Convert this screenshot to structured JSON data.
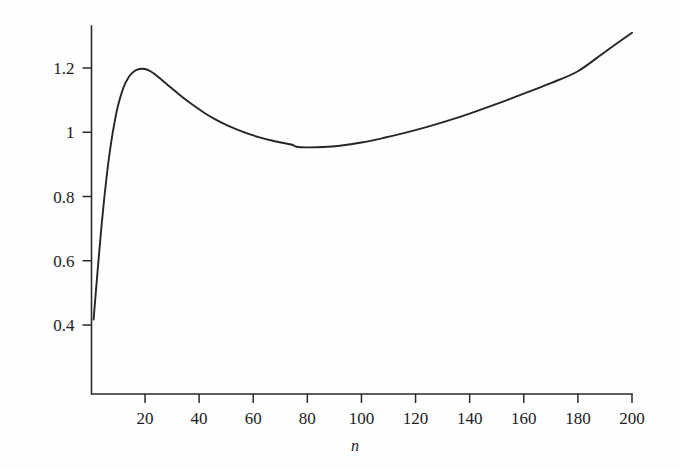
{
  "chart_data": {
    "type": "line",
    "title": "",
    "subtitle": "",
    "xlabel": "n",
    "ylabel": "",
    "xlim": [
      0,
      203
    ],
    "ylim": [
      0.28,
      1.34
    ],
    "grid": false,
    "legend": null,
    "xticks": [
      20,
      40,
      60,
      80,
      100,
      120,
      140,
      160,
      180,
      200
    ],
    "xtick_labels": [
      "20",
      "40",
      "60",
      "80",
      "100",
      "120",
      "140",
      "160",
      "180",
      "200"
    ],
    "yticks": [
      0.4,
      0.6,
      0.8,
      1.0,
      1.2
    ],
    "ytick_labels": [
      "0.4",
      "0.6",
      "0.8",
      "1",
      "1.2"
    ],
    "series": [
      {
        "name": "curve",
        "color": "#262626",
        "x": [
          1,
          2,
          3,
          4,
          5,
          6,
          7,
          8,
          9,
          10,
          12,
          14,
          16,
          18,
          20,
          22,
          24,
          26,
          28,
          30,
          34,
          38,
          42,
          46,
          50,
          56,
          62,
          68,
          74,
          76,
          80,
          86,
          92,
          100,
          108,
          116,
          124,
          132,
          140,
          150,
          160,
          170,
          180,
          190,
          200
        ],
        "y": [
          0.417,
          0.52,
          0.62,
          0.715,
          0.8,
          0.875,
          0.94,
          0.995,
          1.042,
          1.082,
          1.138,
          1.172,
          1.19,
          1.197,
          1.197,
          1.19,
          1.178,
          1.164,
          1.15,
          1.136,
          1.108,
          1.083,
          1.06,
          1.04,
          1.023,
          1.002,
          0.985,
          0.972,
          0.962,
          0.955,
          0.953,
          0.954,
          0.958,
          0.968,
          0.982,
          0.998,
          1.016,
          1.036,
          1.058,
          1.088,
          1.12,
          1.153,
          1.19,
          1.25,
          1.31
        ]
      }
    ],
    "annotations": {
      "peak": {
        "n": 20,
        "value": 1.197
      },
      "minimum": {
        "n": 76,
        "value": 0.953
      },
      "start": {
        "n": 1,
        "value": 0.417
      },
      "end": {
        "n": 200,
        "value": 1.31
      }
    }
  }
}
